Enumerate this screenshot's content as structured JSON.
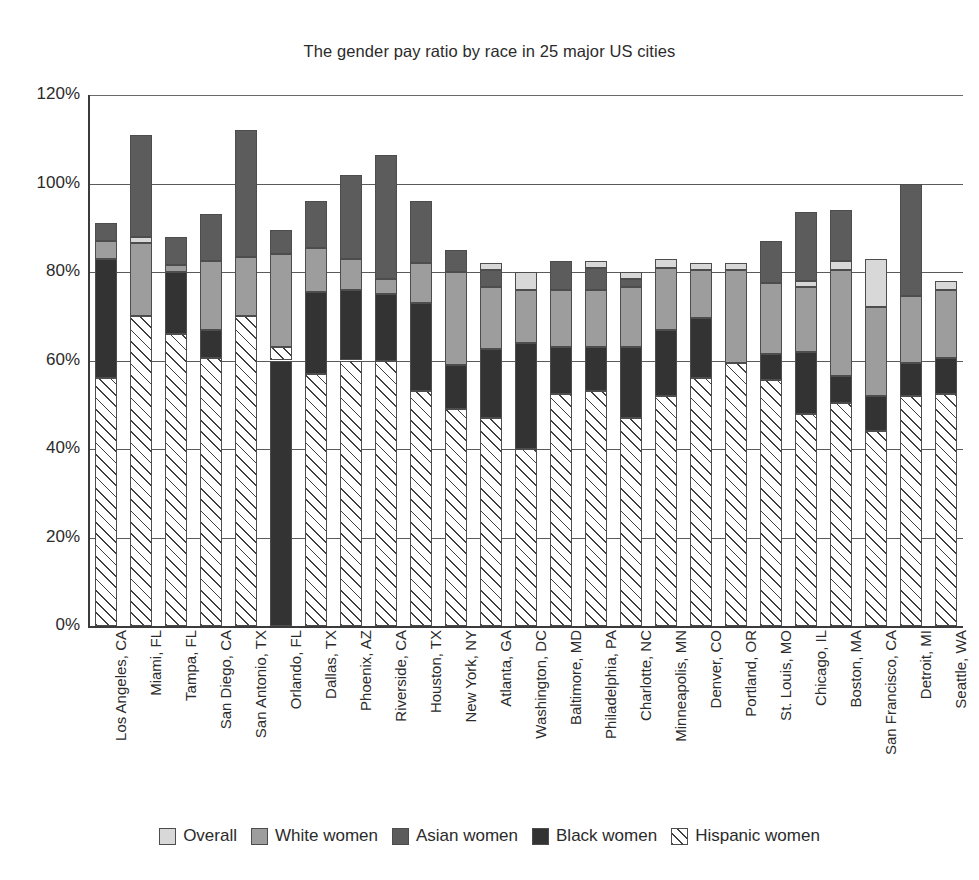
{
  "chart_data": {
    "type": "bar",
    "stacked": true,
    "title": "The gender pay ratio by race in 25 major US cities",
    "xlabel": "",
    "ylabel": "",
    "ylim": [
      0,
      120
    ],
    "ytick_labels": [
      "120%",
      "100%",
      "80%",
      "60%",
      "40%",
      "20%",
      "0%"
    ],
    "yticks": [
      120,
      100,
      80,
      60,
      40,
      20,
      0
    ],
    "grid": true,
    "legend_position": "bottom",
    "series_order": [
      "Hispanic women",
      "Black women",
      "Asian women",
      "White women",
      "Overall"
    ],
    "series": [
      {
        "name": "Overall",
        "color": "#d8d8d8",
        "values": [
          0.0,
          0.0,
          0.0,
          0.0,
          0.0,
          0.0,
          0.0,
          0.0,
          0.0,
          0.0,
          0.0,
          1.5,
          6.0,
          0.0,
          1.5,
          1.5,
          2.0,
          1.5,
          1.5,
          0.0,
          1.5,
          2.0,
          0.0,
          1.5,
          1.5
        ]
      },
      {
        "name": "White women",
        "color": "#9d9d9d",
        "values": [
          2.0,
          16.5,
          1.5,
          15.5,
          13.5,
          21.0,
          10.0,
          7.0,
          3.5,
          9.0,
          3.5,
          5.5,
          4.0,
          6.5,
          6.5,
          10.5,
          15.5,
          11.5,
          21.5,
          5.5,
          15.5,
          13.5,
          10.5,
          21.5,
          1.5
        ]
      },
      {
        "name": "Asian women",
        "color": "#5c5c5c",
        "values": [
          6.0,
          24.0,
          6.5,
          10.5,
          28.5,
          6.0,
          20.5,
          19.0,
          28.0,
          14.0,
          5.0,
          5.0,
          0.0,
          0.0,
          0.0,
          0.0,
          0.0,
          0.0,
          0.0,
          0.0,
          16.5,
          17.0,
          0.0,
          25.5,
          0.0
        ]
      },
      {
        "name": "Black women",
        "color": "#333333",
        "values": [
          27.0,
          0.0,
          14.0,
          6.5,
          0.0,
          60.0,
          0.0,
          0.0,
          0.0,
          0.0,
          0.0,
          0.0,
          0.0,
          0.0,
          0.0,
          0.0,
          0.0,
          0.0,
          0.0,
          0.0,
          0.0,
          0.0,
          0.0,
          0.0,
          0.0
        ]
      },
      {
        "name": "Hispanic women",
        "color": "hatch",
        "values": [
          56.0,
          70.0,
          66.0,
          60.5,
          70.0,
          3.0,
          57.0,
          60.0,
          60.0,
          53.0,
          49.0,
          47.0,
          40.0,
          52.5,
          53.0,
          47.0,
          52.0,
          56.0,
          59.5,
          55.5,
          48.0,
          50.5,
          44.0,
          52.0,
          52.5
        ]
      }
    ],
    "bar_segments_bottom_to_top": [
      {
        "city": "Los Angeles, CA",
        "hispanic": 56.0,
        "black": 83.0,
        "white": 87.0,
        "asian": 91.0,
        "overall": 91.0,
        "total": 91.0
      },
      {
        "city": "Miami, FL",
        "hispanic": 70.0,
        "white": 86.5,
        "overall": 88.0,
        "asian": 111.0,
        "total": 111.0
      },
      {
        "city": "Tampa, FL",
        "hispanic": 66.0,
        "black": 80.0,
        "white": 81.5,
        "asian": 88.0,
        "total": 88.0
      },
      {
        "city": "San Diego, CA",
        "hispanic": 60.5,
        "black": 67.0,
        "white": 82.5,
        "asian": 93.0,
        "total": 93.0
      },
      {
        "city": "San Antonio, TX",
        "hispanic": 70.0,
        "white": 83.5,
        "asian": 112.0,
        "total": 112.0
      },
      {
        "city": "Orlando, FL",
        "black": 60.0,
        "hispanic": 63.0,
        "white": 84.0,
        "asian": 89.5,
        "total": 89.5
      },
      {
        "city": "Dallas, TX",
        "hispanic": 57.0,
        "black": 75.5,
        "white": 85.5,
        "asian": 96.0,
        "total": 96.0
      },
      {
        "city": "Phoenix, AZ",
        "hispanic": 60.0,
        "black": 76.0,
        "white": 83.0,
        "asian": 102.0,
        "total": 102.0
      },
      {
        "city": "Riverside, CA",
        "hispanic": 60.0,
        "black": 75.0,
        "white": 78.5,
        "asian": 106.5,
        "total": 106.5
      },
      {
        "city": "Houston, TX",
        "hispanic": 53.0,
        "black": 73.0,
        "white": 82.0,
        "asian": 96.0,
        "total": 96.0
      },
      {
        "city": "New York, NY",
        "hispanic": 49.0,
        "black": 59.0,
        "white": 80.0,
        "asian": 85.0,
        "total": 85.0
      },
      {
        "city": "Atlanta, GA",
        "hispanic": 47.0,
        "black": 62.5,
        "white": 76.5,
        "asian": 80.5,
        "overall": 82.0,
        "total": 82.0
      },
      {
        "city": "Washington, DC",
        "hispanic": 40.0,
        "black": 64.0,
        "white": 76.0,
        "overall": 80.0,
        "total": 86.0
      },
      {
        "city": "Baltimore, MD",
        "hispanic": 52.5,
        "black": 63.0,
        "white": 76.0,
        "asian": 82.5,
        "total": 82.5
      },
      {
        "city": "Philadelphia, PA",
        "hispanic": 53.0,
        "black": 63.0,
        "white": 76.0,
        "asian": 81.0,
        "overall": 82.5,
        "total": 82.5
      },
      {
        "city": "Charlotte, NC",
        "hispanic": 47.0,
        "black": 63.0,
        "white": 76.5,
        "asian": 78.5,
        "overall": 80.0,
        "total": 80.0
      },
      {
        "city": "Minneapolis, MN",
        "hispanic": 52.0,
        "black": 67.0,
        "white": 81.0,
        "overall": 83.0,
        "total": 83.0
      },
      {
        "city": "Denver, CO",
        "hispanic": 56.0,
        "black": 69.5,
        "white": 80.5,
        "overall": 82.0,
        "total": 82.0
      },
      {
        "city": "Portland, OR",
        "hispanic": 59.5,
        "white": 80.5,
        "overall": 82.0,
        "total": 82.0
      },
      {
        "city": "St. Louis, MO",
        "hispanic": 55.5,
        "black": 61.5,
        "white": 77.5,
        "asian": 87.0,
        "total": 87.0
      },
      {
        "city": "Chicago, IL",
        "hispanic": 48.0,
        "black": 62.0,
        "white": 76.5,
        "overall": 78.0,
        "asian": 93.5,
        "total": 93.5
      },
      {
        "city": "Boston, MA",
        "hispanic": 50.5,
        "black": 56.5,
        "white": 80.5,
        "overall": 82.5,
        "asian": 94.0,
        "total": 94.0
      },
      {
        "city": "San Francisco, CA",
        "hispanic": 44.0,
        "black": 52.0,
        "white": 72.0,
        "overall": 83.0,
        "total": 83.0
      },
      {
        "city": "Detroit, MI",
        "hispanic": 52.0,
        "black": 59.5,
        "white": 74.5,
        "asian": 100.0,
        "total": 100.0
      },
      {
        "city": "Seattle, WA",
        "hispanic": 52.5,
        "black": 60.5,
        "white": 76.0,
        "overall": 78.0,
        "total": 78.0
      }
    ],
    "categories": [
      "Los Angeles, CA",
      "Miami, FL",
      "Tampa, FL",
      "San Diego, CA",
      "San Antonio, TX",
      "Orlando, FL",
      "Dallas, TX",
      "Phoenix, AZ",
      "Riverside, CA",
      "Houston, TX",
      "New York, NY",
      "Atlanta, GA",
      "Washington, DC",
      "Baltimore, MD",
      "Philadelphia, PA",
      "Charlotte, NC",
      "Minneapolis, MN",
      "Denver, CO",
      "Portland, OR",
      "St. Louis, MO",
      "Chicago, IL",
      "Boston, MA",
      "San Francisco, CA",
      "Detroit, MI",
      "Seattle, WA"
    ]
  },
  "legend": {
    "items": [
      {
        "label": "Overall",
        "key": "overall",
        "color": "#d8d8d8"
      },
      {
        "label": "White women",
        "key": "white",
        "color": "#9d9d9d"
      },
      {
        "label": "Asian women",
        "key": "asian",
        "color": "#5c5c5c"
      },
      {
        "label": "Black women",
        "key": "black",
        "color": "#333333"
      },
      {
        "label": "Hispanic women",
        "key": "hispanic",
        "color": "hatch"
      }
    ]
  }
}
